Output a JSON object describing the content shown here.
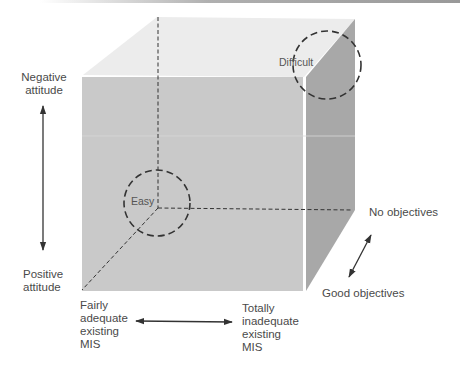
{
  "diagram": {
    "type": "3d-cube-matrix",
    "colors": {
      "top_face": "#ececec",
      "front_face": "#c9c9c9",
      "side_face": "#a9a9a9",
      "line": "#333333",
      "text": "#4a4a4a"
    },
    "circles": {
      "easy": "Easy",
      "difficult": "Difficult"
    },
    "axes": {
      "vertical": {
        "top": "Negative\nattitude",
        "top_lines": [
          "Negative",
          "attitude"
        ],
        "bottom_lines": [
          "Positive",
          "attitude"
        ]
      },
      "horizontal": {
        "left_lines": [
          "Fairly",
          "adequate",
          "existing",
          "MIS"
        ],
        "right_lines": [
          "Totally",
          "inadequate",
          "existing",
          "MIS"
        ]
      },
      "depth": {
        "back": "No objectives",
        "front": "Good objectives"
      }
    }
  }
}
